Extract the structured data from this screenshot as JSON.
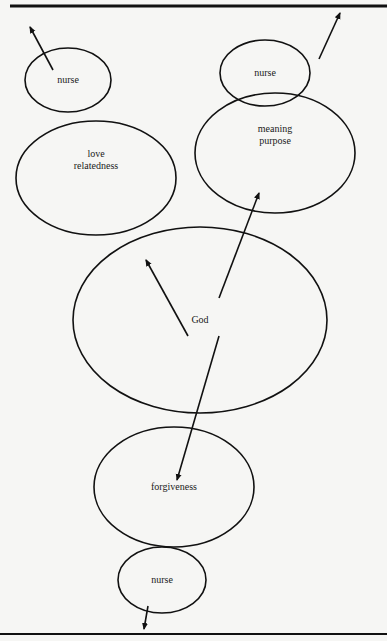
{
  "diagram": {
    "type": "node-arrow diagram",
    "nodes": [
      {
        "id": "nurse-top-left",
        "label": "nurse",
        "cx": 68,
        "cy": 80,
        "rx": 43,
        "ry": 32
      },
      {
        "id": "love",
        "label_line1": "love",
        "label_line2": "relatedness",
        "cx": 96,
        "cy": 178,
        "rx": 80,
        "ry": 57
      },
      {
        "id": "nurse-top-right",
        "label": "nurse",
        "cx": 265,
        "cy": 73,
        "rx": 45,
        "ry": 33
      },
      {
        "id": "meaning",
        "label_line1": "meaning",
        "label_line2": "purpose",
        "cx": 275,
        "cy": 153,
        "rx": 80,
        "ry": 60
      },
      {
        "id": "god",
        "label": "God",
        "cx": 200,
        "cy": 320,
        "rx": 127,
        "ry": 93
      },
      {
        "id": "forgiveness",
        "label": "forgiveness",
        "cx": 174,
        "cy": 487,
        "rx": 80,
        "ry": 60
      },
      {
        "id": "nurse-bottom",
        "label": "nurse",
        "cx": 162,
        "cy": 580,
        "rx": 44,
        "ry": 33
      }
    ],
    "arrows": [
      {
        "from": "god",
        "to": "love",
        "x1": 188,
        "y1": 336,
        "x2": 146,
        "y2": 260
      },
      {
        "from": "god",
        "to": "meaning",
        "x1": 219,
        "y1": 298,
        "x2": 259,
        "y2": 193
      },
      {
        "from": "god",
        "to": "forgiveness",
        "x1": 219,
        "y1": 336,
        "x2": 177,
        "y2": 480
      },
      {
        "from": "nurse-top-left",
        "to": "outside",
        "x1": 53,
        "y1": 70,
        "x2": 30,
        "y2": 27
      },
      {
        "from": "nurse-top-right",
        "to": "outside",
        "x1": 319,
        "y1": 59,
        "x2": 340,
        "y2": 13
      },
      {
        "from": "nurse-bottom",
        "to": "outside",
        "x1": 148,
        "y1": 606,
        "x2": 144,
        "y2": 629
      }
    ],
    "rules": [
      {
        "position": "top",
        "y": 6
      },
      {
        "position": "bottom",
        "y": 634
      }
    ],
    "colors": {
      "ink": "#111111",
      "paper": "#f6f6f4"
    }
  }
}
